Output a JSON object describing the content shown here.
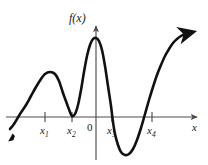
{
  "figure": {
    "kind": "function-graph",
    "corner_mark": "",
    "axes": {
      "y_axis_label": "f(x)",
      "x_axis_label": "x",
      "origin_label": "0",
      "x_axis_y_px": 117,
      "y_axis_x_px": 96,
      "x_axis_left_px": 6,
      "x_axis_right_px": 200,
      "y_axis_top_px": 22,
      "y_axis_bottom_px": 160,
      "grid": false,
      "left_arrow": false,
      "right_arrow": true,
      "up_arrow": true
    },
    "ticks": [
      {
        "id": "x1",
        "label": "x",
        "sub": "1",
        "x_px": 45
      },
      {
        "id": "x2",
        "label": "x",
        "sub": "2",
        "x_px": 72
      },
      {
        "id": "x3",
        "label": "x",
        "sub": "3",
        "x_px": 112
      },
      {
        "id": "x4",
        "label": "x",
        "sub": "4",
        "x_px": 152
      }
    ],
    "curve": {
      "stroke": "#111111",
      "stroke_width": 2.6,
      "start_arrow": "down-left",
      "end_arrow": "up-right"
    },
    "colors": {
      "curve": "#111111",
      "axis": "#4d4d4d",
      "text": "#1a1a1a",
      "background": "#ffffff"
    }
  },
  "chart_data": {
    "type": "line",
    "title": "",
    "xlabel": "x",
    "ylabel": "f(x)",
    "grid": false,
    "legend": null,
    "xlim": [
      6,
      200
    ],
    "ylim": [
      165,
      22
    ],
    "annotations": [
      {
        "text": "f(x)",
        "role": "y-axis-label"
      },
      {
        "text": "x",
        "role": "x-axis-label"
      },
      {
        "text": "0",
        "role": "origin"
      },
      {
        "text": "x1",
        "role": "x-axis-tick"
      },
      {
        "text": "x2",
        "role": "x-axis-tick"
      },
      {
        "text": "x3",
        "role": "x-axis-tick"
      },
      {
        "text": "x4",
        "role": "x-axis-tick"
      }
    ],
    "features": [
      {
        "type": "x-intercept-crossing",
        "at": "left of x1, near x=12"
      },
      {
        "type": "local-maximum",
        "at": "x1",
        "above_axis": true
      },
      {
        "type": "local-minimum-tangent",
        "at": "x2",
        "touches_axis": true
      },
      {
        "type": "local-maximum",
        "at": "just left of 0",
        "above_axis": true
      },
      {
        "type": "x-intercept-crossing",
        "at": "x3"
      },
      {
        "type": "local-minimum",
        "at": "between x3 and x4",
        "below_axis": true
      },
      {
        "type": "x-intercept-crossing",
        "at": "x4"
      },
      {
        "type": "increasing-to-arrow",
        "at": "right end"
      }
    ],
    "series": [
      {
        "name": "f(x)",
        "points_px": [
          [
            10,
            129
          ],
          [
            14,
            124
          ],
          [
            20,
            114
          ],
          [
            26,
            105
          ],
          [
            31,
            96
          ],
          [
            36,
            87
          ],
          [
            41,
            79
          ],
          [
            45,
            74
          ],
          [
            50,
            72
          ],
          [
            55,
            74
          ],
          [
            59,
            81
          ],
          [
            63,
            93
          ],
          [
            67,
            104
          ],
          [
            70,
            112
          ],
          [
            72,
            116
          ],
          [
            75,
            114
          ],
          [
            78,
            105
          ],
          [
            81,
            90
          ],
          [
            84,
            72
          ],
          [
            87,
            56
          ],
          [
            90,
            45
          ],
          [
            93,
            39
          ],
          [
            96,
            38
          ],
          [
            99,
            41
          ],
          [
            102,
            50
          ],
          [
            105,
            66
          ],
          [
            108,
            86
          ],
          [
            111,
            106
          ],
          [
            113,
            122
          ],
          [
            115,
            134
          ],
          [
            118,
            145
          ],
          [
            121,
            152
          ],
          [
            125,
            155
          ],
          [
            129,
            154
          ],
          [
            133,
            149
          ],
          [
            137,
            140
          ],
          [
            141,
            128
          ],
          [
            145,
            114
          ],
          [
            149,
            100
          ],
          [
            153,
            87
          ],
          [
            157,
            75
          ],
          [
            161,
            65
          ],
          [
            165,
            56
          ],
          [
            169,
            49
          ],
          [
            173,
            43
          ],
          [
            177,
            39
          ],
          [
            181,
            36
          ],
          [
            185,
            34
          ],
          [
            189,
            33
          ]
        ]
      }
    ]
  }
}
